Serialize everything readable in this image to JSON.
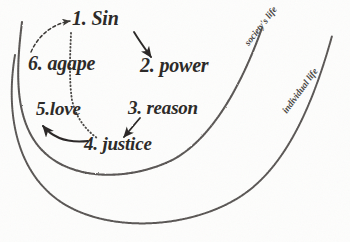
{
  "diagram": {
    "background_color": "#fdfdfc",
    "ink_color": "#2a2826",
    "arc_color": "#5a5754",
    "nodes": [
      {
        "id": "sin",
        "label": "1. Sin"
      },
      {
        "id": "power",
        "label": "2. power"
      },
      {
        "id": "reason",
        "label": "3. reason"
      },
      {
        "id": "justice",
        "label": "4. justice"
      },
      {
        "id": "love",
        "label": "5.love"
      },
      {
        "id": "agape",
        "label": "6. agape"
      }
    ],
    "arcs": [
      {
        "id": "society",
        "label": "society's life"
      },
      {
        "id": "individual",
        "label": "individual life"
      }
    ],
    "connectors": [
      {
        "from": "sin",
        "to": "power",
        "style": "solid-arrow"
      },
      {
        "from": "power",
        "to": "reason",
        "style": "solid-arrow"
      },
      {
        "from": "reason",
        "to": "justice",
        "style": "solid-arrow"
      },
      {
        "from": "justice",
        "to": "love",
        "style": "solid-curved-arrow"
      },
      {
        "from": "agape",
        "to": "sin",
        "style": "dashed-curved-arrow"
      },
      {
        "from": "sin",
        "to": "justice",
        "style": "dotted-line"
      }
    ]
  }
}
